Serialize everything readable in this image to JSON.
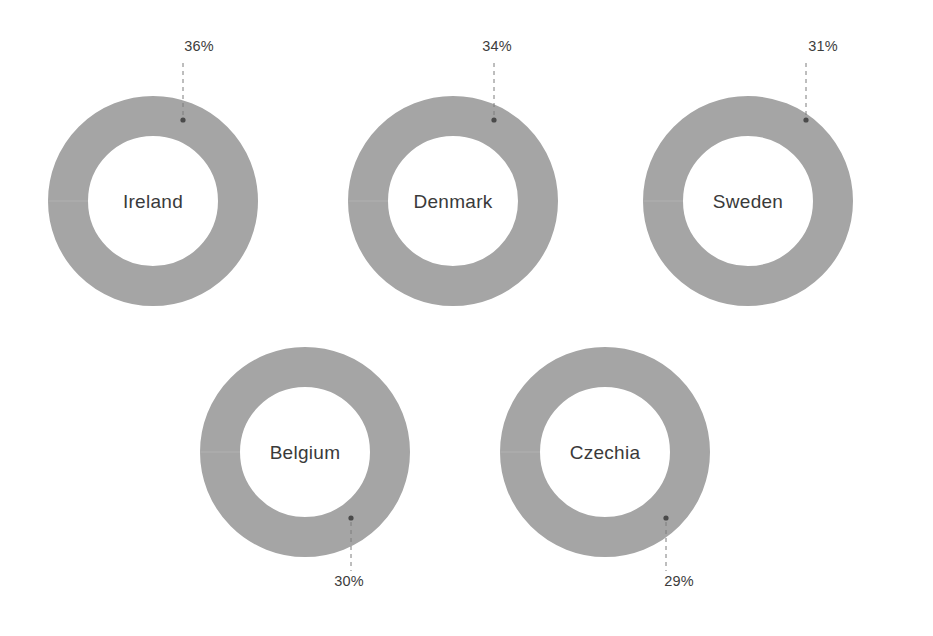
{
  "chart_data": {
    "type": "pie",
    "title": "",
    "subtitle": "",
    "xlabel": "",
    "ylabel": "",
    "legend": [],
    "grid": false,
    "variant": "donut-grid",
    "units": "percent",
    "value_suffix": "%",
    "categories": [
      "Ireland",
      "Denmark",
      "Sweden",
      "Belgium",
      "Czechia"
    ],
    "values": [
      36,
      34,
      31,
      30,
      29
    ],
    "series": [
      {
        "name": "share",
        "values": [
          36,
          34,
          31,
          30,
          29
        ]
      }
    ],
    "annotations": [
      {
        "label": "36%",
        "target": "Ireland",
        "position": "above"
      },
      {
        "label": "34%",
        "target": "Denmark",
        "position": "above"
      },
      {
        "label": "31%",
        "target": "Sweden",
        "position": "above"
      },
      {
        "label": "30%",
        "target": "Belgium",
        "position": "below"
      },
      {
        "label": "29%",
        "target": "Czechia",
        "position": "below"
      }
    ]
  },
  "style": {
    "background": "#ffffff",
    "ring_fill": "#a5a5a5",
    "ring_track": "#ffffff",
    "seam": "#b1b1b1",
    "label_color": "#3c3c3c",
    "name_color": "#3a3a3a",
    "leader_color": "#7d7d7d",
    "dot_color": "#4a4a4a"
  },
  "donuts": [
    {
      "id": "ireland",
      "name": "Ireland",
      "value": 36,
      "value_label": "36%",
      "cx": 153,
      "cy": 201,
      "r_outer": 105,
      "r_inner": 65,
      "label_x": 199,
      "label_y": 51,
      "leader_x": 183,
      "leader_y1": 63,
      "leader_y2": 116,
      "dot_x": 183,
      "dot_y": 120,
      "label_anchor": "middle",
      "label_position": "above"
    },
    {
      "id": "denmark",
      "name": "Denmark",
      "value": 34,
      "value_label": "34%",
      "cx": 453,
      "cy": 201,
      "r_outer": 105,
      "r_inner": 65,
      "label_x": 497,
      "label_y": 51,
      "leader_x": 494,
      "leader_y1": 63,
      "leader_y2": 116,
      "dot_x": 494,
      "dot_y": 120,
      "label_anchor": "middle",
      "label_position": "above"
    },
    {
      "id": "sweden",
      "name": "Sweden",
      "value": 31,
      "value_label": "31%",
      "cx": 748,
      "cy": 201,
      "r_outer": 105,
      "r_inner": 65,
      "label_x": 823,
      "label_y": 51,
      "leader_x": 806,
      "leader_y1": 63,
      "leader_y2": 116,
      "dot_x": 806,
      "dot_y": 120,
      "label_anchor": "middle",
      "label_position": "above"
    },
    {
      "id": "belgium",
      "name": "Belgium",
      "value": 30,
      "value_label": "30%",
      "cx": 305,
      "cy": 452,
      "r_outer": 105,
      "r_inner": 65,
      "label_x": 349,
      "label_y": 586,
      "leader_x": 351,
      "leader_y1": 522,
      "leader_y2": 571,
      "dot_x": 351,
      "dot_y": 518,
      "label_anchor": "middle",
      "label_position": "below"
    },
    {
      "id": "czechia",
      "name": "Czechia",
      "value": 29,
      "value_label": "29%",
      "cx": 605,
      "cy": 452,
      "r_outer": 105,
      "r_inner": 65,
      "label_x": 679,
      "label_y": 586,
      "leader_x": 666,
      "leader_y1": 522,
      "leader_y2": 571,
      "dot_x": 666,
      "dot_y": 518,
      "label_anchor": "middle",
      "label_position": "below"
    }
  ]
}
